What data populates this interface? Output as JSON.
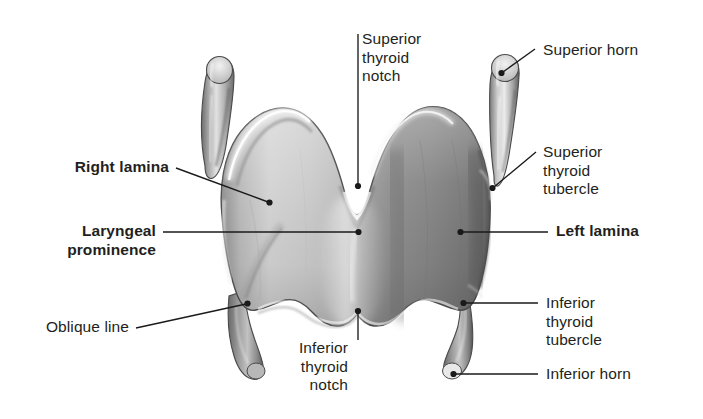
{
  "figure": {
    "background_color": "#ffffff",
    "text_color": "#231f20",
    "leader_color": "#1a1a1a"
  },
  "labels": {
    "superior_thyroid_notch": "Superior\nthyroid\nnotch",
    "superior_horn": "Superior horn",
    "superior_thyroid_tubercle": "Superior\nthyroid\ntubercle",
    "right_lamina": "Right lamina",
    "laryngeal_prominence": "Laryngeal\nprominence",
    "left_lamina": "Left lamina",
    "oblique_line": "Oblique line",
    "inferior_thyroid_notch": "Inferior\nthyroid\nnotch",
    "inferior_thyroid_tubercle": "Inferior\nthyroid\ntubercle",
    "inferior_horn": "Inferior horn"
  },
  "structures": [
    "right lamina",
    "left lamina",
    "laryngeal prominence",
    "superior thyroid notch",
    "inferior thyroid notch",
    "right superior horn",
    "left superior horn",
    "right inferior horn",
    "left inferior horn",
    "oblique line",
    "superior thyroid tubercle",
    "inferior thyroid tubercle"
  ]
}
